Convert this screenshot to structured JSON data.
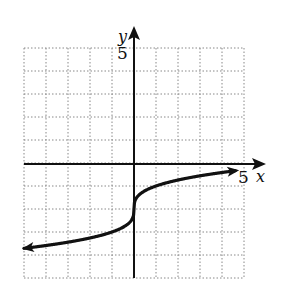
{
  "chart_data": {
    "type": "line",
    "title": "",
    "xlabel": "x",
    "ylabel": "y",
    "xlim": [
      -5,
      5
    ],
    "ylim": [
      -5,
      5
    ],
    "grid": true,
    "tick_labels": {
      "x": [
        "5"
      ],
      "y": [
        "5"
      ]
    },
    "series": [
      {
        "name": "y = cbrt(x) - 2",
        "x": [
          -5,
          -4,
          -3,
          -2,
          -1,
          -0.5,
          -0.1,
          0,
          0.1,
          0.5,
          1,
          2,
          3,
          4,
          5
        ],
        "y": [
          -3.71,
          -3.59,
          -3.44,
          -3.26,
          -3.0,
          -2.79,
          -2.46,
          -2.0,
          -1.54,
          -1.21,
          -1.0,
          -0.74,
          -0.56,
          -0.41,
          -0.29
        ]
      }
    ],
    "arrows": [
      "left-end",
      "right-end"
    ]
  },
  "labels": {
    "x_axis": "x",
    "y_axis": "y",
    "x_tick": "5",
    "y_tick": "5"
  }
}
